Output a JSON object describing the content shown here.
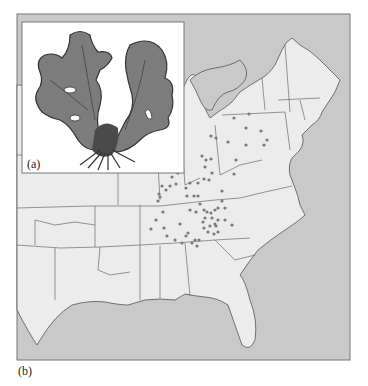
{
  "figure": {
    "panel_a": {
      "label": "(a)",
      "content": "illustration of a leafy lichen/plant (dark gray lobed fronds with root-like base)"
    },
    "panel_b": {
      "label": "(b)",
      "content": "map of eastern United States with state boundaries and gray dots marking occurrence locations"
    }
  },
  "colors": {
    "ocean": "#c9c9c9",
    "land": "#ececec",
    "border": "#555555",
    "dot": "#7a7a7a",
    "plant_dark": "#4a4a4a",
    "plant_mid": "#7c7c7c",
    "inset_bg": "#ffffff"
  },
  "dots": [
    [
      234,
      118
    ],
    [
      249,
      114
    ],
    [
      246,
      128
    ],
    [
      261,
      131
    ],
    [
      228,
      142
    ],
    [
      246,
      145
    ],
    [
      264,
      145
    ],
    [
      267,
      140
    ],
    [
      211,
      136
    ],
    [
      216,
      138
    ],
    [
      202,
      156
    ],
    [
      206,
      160
    ],
    [
      211,
      159
    ],
    [
      236,
      160
    ],
    [
      234,
      174
    ],
    [
      205,
      167
    ],
    [
      204,
      179
    ],
    [
      190,
      183
    ],
    [
      186,
      188
    ],
    [
      198,
      183
    ],
    [
      209,
      180
    ],
    [
      212,
      173
    ],
    [
      194,
      196
    ],
    [
      198,
      196
    ],
    [
      178,
      173
    ],
    [
      172,
      177
    ],
    [
      170,
      186
    ],
    [
      176,
      184
    ],
    [
      166,
      190
    ],
    [
      160,
      197
    ],
    [
      158,
      201
    ],
    [
      159,
      194
    ],
    [
      162,
      186
    ],
    [
      187,
      196
    ],
    [
      196,
      212
    ],
    [
      204,
      210
    ],
    [
      222,
      191
    ],
    [
      222,
      201
    ],
    [
      215,
      224
    ],
    [
      225,
      220
    ],
    [
      232,
      225
    ],
    [
      200,
      204
    ],
    [
      207,
      212
    ],
    [
      211,
      213
    ],
    [
      215,
      210
    ],
    [
      218,
      208
    ],
    [
      205,
      218
    ],
    [
      212,
      218
    ],
    [
      218,
      220
    ],
    [
      203,
      222
    ],
    [
      210,
      226
    ],
    [
      216,
      226
    ],
    [
      208,
      232
    ],
    [
      218,
      232
    ],
    [
      204,
      228
    ],
    [
      190,
      210
    ],
    [
      180,
      224
    ],
    [
      163,
      212
    ],
    [
      156,
      220
    ],
    [
      151,
      229
    ],
    [
      164,
      228
    ],
    [
      167,
      236
    ],
    [
      182,
      243
    ],
    [
      175,
      240
    ],
    [
      195,
      240
    ],
    [
      186,
      236
    ],
    [
      188,
      233
    ],
    [
      192,
      243
    ],
    [
      197,
      246
    ],
    [
      199,
      240
    ],
    [
      214,
      234
    ],
    [
      225,
      208
    ]
  ]
}
